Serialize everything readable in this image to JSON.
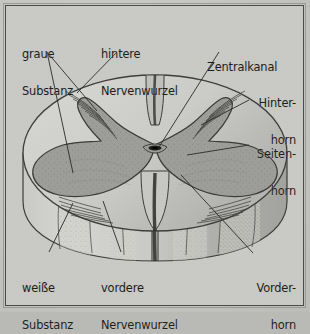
{
  "figure": {
    "background_color": "#c6c6c2",
    "frame_color": "#4a4a47",
    "ink_color": "#1d1d1b",
    "gray_matter_color": "#9b9b97",
    "white_matter_color": "#cfcfcb",
    "leader_color": "#3a3a38"
  },
  "labels": {
    "graue_substanz": {
      "line1": "graue",
      "line2": "Substanz"
    },
    "hintere_nervenwurzel": {
      "line1": "hintere",
      "line2": "Nervenwurzel"
    },
    "zentralkanal": {
      "line1": "Zentralkanal",
      "line2": ""
    },
    "hinterhorn": {
      "line1": "Hinter-",
      "line2": "horn"
    },
    "seitenhorn": {
      "line1": "Seiten-",
      "line2": "horn"
    },
    "vorderhorn": {
      "line1": "Vorder-",
      "line2": "horn"
    },
    "weisse_substanz": {
      "line1": "weiße",
      "line2": "Substanz"
    },
    "vordere_nervenwurzel": {
      "line1": "vordere",
      "line2": "Nervenwurzel"
    }
  }
}
